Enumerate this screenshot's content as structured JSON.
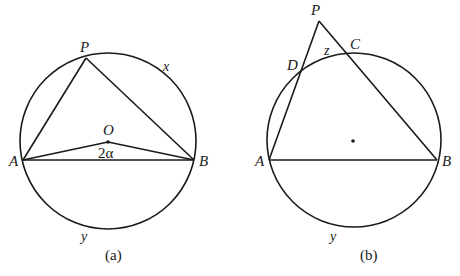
{
  "figure_a": {
    "caption": "(a)",
    "circle": {
      "cx": 108,
      "cy": 141,
      "r": 88
    },
    "points": {
      "A": {
        "label": "A",
        "x": 23,
        "y": 160
      },
      "B": {
        "label": "B",
        "x": 194,
        "y": 160
      },
      "P": {
        "label": "P",
        "x": 86,
        "y": 58
      },
      "O": {
        "label": "O",
        "x": 108,
        "y": 142
      }
    },
    "angle_label": "2α",
    "arc_labels": {
      "x": "x",
      "y": "y"
    }
  },
  "figure_b": {
    "caption": "(b)",
    "circle": {
      "cx": 354,
      "cy": 140,
      "r": 87
    },
    "points": {
      "A": {
        "label": "A",
        "x": 269,
        "y": 160
      },
      "B": {
        "label": "B",
        "x": 437,
        "y": 160
      },
      "P": {
        "label": "P",
        "x": 319,
        "y": 21
      },
      "C": {
        "label": "C",
        "x": 347,
        "y": 54
      },
      "D": {
        "label": "D",
        "x": 302,
        "y": 71
      }
    },
    "center_dot": {
      "x": 353,
      "y": 141
    },
    "arc_labels": {
      "z": "z",
      "y": "y"
    }
  }
}
